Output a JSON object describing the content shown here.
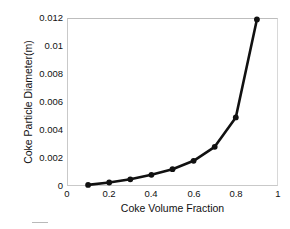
{
  "chart_data": {
    "type": "line",
    "title": "",
    "subtitle": "",
    "xlabel": "Coke Volume Fraction",
    "ylabel": "Coke Particle Diameter(m)",
    "xlim": [
      0,
      1
    ],
    "ylim": [
      0,
      0.012
    ],
    "xticks": [
      "0",
      "0.2",
      "0.4",
      "0.6",
      "0.8",
      "1"
    ],
    "xtick_values": [
      0,
      0.2,
      0.4,
      0.6,
      0.8,
      1
    ],
    "yticks": [
      "0",
      "0.002",
      "0.004",
      "0.006",
      "0.008",
      "0.01",
      "0.012"
    ],
    "ytick_values": [
      0,
      0.002,
      0.004,
      0.006,
      0.008,
      0.01,
      0.012
    ],
    "grid": false,
    "legend": false,
    "legend_position": "none",
    "marker": "filled-circle",
    "marker_color": "#111111",
    "line_color": "#111111",
    "line_width": 2.6,
    "x": [
      0.1,
      0.2,
      0.3,
      0.4,
      0.5,
      0.6,
      0.7,
      0.8,
      0.9
    ],
    "y": [
      8e-05,
      0.00025,
      0.00048,
      0.0008,
      0.0012,
      0.0018,
      0.0028,
      0.0049,
      0.0119
    ],
    "series": [
      {
        "name": "Coke particle diameter",
        "x": [
          0.1,
          0.2,
          0.3,
          0.4,
          0.5,
          0.6,
          0.7,
          0.8,
          0.9
        ],
        "values": [
          8e-05,
          0.00025,
          0.00048,
          0.0008,
          0.0012,
          0.0018,
          0.0028,
          0.0049,
          0.0119
        ]
      }
    ],
    "annotations": []
  },
  "axes": {
    "y_tick_labels": [
      "0.012",
      "0.01",
      "0.008",
      "0.006",
      "0.004",
      "0.002",
      "0"
    ],
    "x_tick_labels": [
      "0",
      "0.2",
      "0.4",
      "0.6",
      "0.8",
      "1"
    ],
    "x_title": "Coke Volume Fraction",
    "y_title": "Coke Particle Diameter(m)"
  },
  "colors": {
    "line": "#111111",
    "marker": "#111111",
    "frame": "#c9c9c9",
    "text": "#111111",
    "background": "#ffffff"
  }
}
